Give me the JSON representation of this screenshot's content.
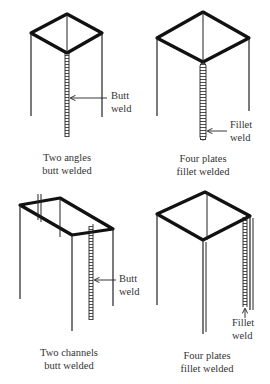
{
  "diagram": {
    "panels": [
      {
        "id": "two-angles",
        "caption_line1": "Two angles",
        "caption_line2": "butt welded",
        "weld_label_line1": "Butt",
        "weld_label_line2": "weld",
        "weld_type": "butt"
      },
      {
        "id": "four-plates-top",
        "caption_line1": "Four plates",
        "caption_line2": "fillet welded",
        "weld_label_line1": "Fillet",
        "weld_label_line2": "weld",
        "weld_type": "fillet"
      },
      {
        "id": "two-channels",
        "caption_line1": "Two channels",
        "caption_line2": "butt welded",
        "weld_label_line1": "Butt",
        "weld_label_line2": "weld",
        "weld_type": "butt"
      },
      {
        "id": "four-plates-bottom",
        "caption_line1": "Four plates",
        "caption_line2": "fillet welded",
        "weld_label_line1": "Fillet",
        "weld_label_line2": "weld",
        "weld_type": "fillet"
      }
    ],
    "colors": {
      "line": "#1a1a1a",
      "background": "#ffffff"
    }
  }
}
